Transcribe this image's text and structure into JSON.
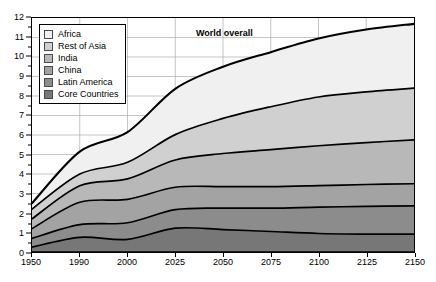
{
  "chart_data": {
    "type": "area",
    "stacked": true,
    "title": "",
    "subtitle": "",
    "xlabel": "",
    "ylabel": "",
    "xlim": [
      1950,
      2150
    ],
    "ylim": [
      0,
      12
    ],
    "y_ticks": [
      0,
      1,
      2,
      3,
      4,
      5,
      6,
      7,
      8,
      9,
      10,
      11,
      12
    ],
    "y_minor_ticks": [
      0.5,
      1.5,
      2.5,
      3.5,
      4.5,
      5.5,
      6.5,
      7.5,
      8.5,
      9.5,
      10.5,
      11.5
    ],
    "x_ticks": [
      1950,
      1990,
      2000,
      2025,
      2050,
      2075,
      2100,
      2125,
      2150
    ],
    "x_tick_labels": [
      "1950",
      "1990",
      "2000",
      "2025",
      "2050",
      "2075",
      "2100",
      "2125",
      "2150"
    ],
    "x_positions_equal_spaced": true,
    "grid": true,
    "grid_color": "#aaaaaa",
    "legend_position": "top-left",
    "annotations": [
      {
        "text": "World overall",
        "x": 2050,
        "y": 11.1,
        "bold": true
      }
    ],
    "series": [
      {
        "name": "Core Countries",
        "color": "#777777",
        "values": [
          0.25,
          0.75,
          0.65,
          1.22,
          1.15,
          1.05,
          0.95,
          0.92,
          0.92
        ]
      },
      {
        "name": "Latin America",
        "color": "#8c8c8c",
        "values": [
          0.45,
          0.65,
          0.85,
          0.95,
          1.1,
          1.2,
          1.35,
          1.42,
          1.45
        ]
      },
      {
        "name": "China",
        "color": "#a3a3a3",
        "values": [
          0.5,
          1.15,
          1.2,
          1.15,
          1.1,
          1.1,
          1.1,
          1.12,
          1.13
        ]
      },
      {
        "name": "India",
        "color": "#b8b8b8",
        "values": [
          0.5,
          0.85,
          1.05,
          1.4,
          1.7,
          1.9,
          2.05,
          2.15,
          2.25
        ]
      },
      {
        "name": "Rest of Asia",
        "color": "#d0d0d0",
        "values": [
          0.5,
          0.6,
          0.85,
          1.3,
          1.8,
          2.2,
          2.5,
          2.6,
          2.65
        ]
      },
      {
        "name": "Africa",
        "color": "#f0f0f0",
        "values": [
          0.3,
          1.15,
          1.55,
          2.35,
          2.65,
          2.8,
          3.0,
          3.2,
          3.3
        ]
      }
    ],
    "cumulative_totals": [
      2.5,
      5.15,
      6.15,
      8.39,
      9.5,
      10.25,
      10.95,
      11.41,
      11.7
    ],
    "units": "billions of people"
  },
  "legend": {
    "items": [
      {
        "label": "Africa",
        "color": "#f0f0f0"
      },
      {
        "label": "Rest of Asia",
        "color": "#d0d0d0"
      },
      {
        "label": "India",
        "color": "#b8b8b8"
      },
      {
        "label": "China",
        "color": "#a3a3a3"
      },
      {
        "label": "Latin America",
        "color": "#8c8c8c"
      },
      {
        "label": "Core Countries",
        "color": "#777777"
      }
    ]
  },
  "annotation": {
    "world_overall": "World overall"
  }
}
